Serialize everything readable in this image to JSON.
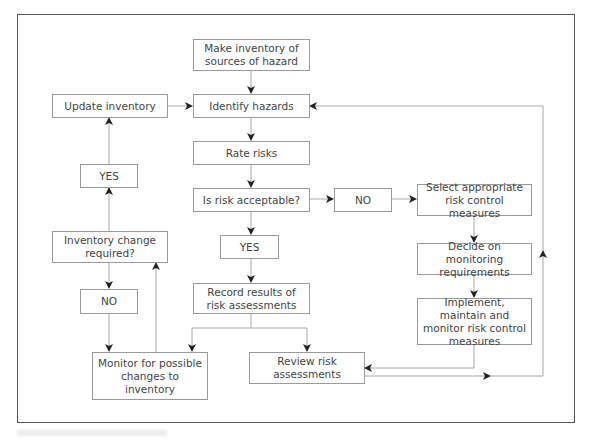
{
  "diagram": {
    "nodes": {
      "make_inventory": "Make inventory of sources of hazard",
      "update_inventory": "Update inventory",
      "identify_hazards": "Identify hazards",
      "rate_risks": "Rate risks",
      "yes_left": "YES",
      "is_risk_acceptable": "Is risk acceptable?",
      "no_middle": "NO",
      "select_measures": "Select appropriate risk control measures",
      "inventory_change": "Inventory change required?",
      "yes_center": "YES",
      "decide_monitoring": "Decide on monitoring requirements",
      "no_left": "NO",
      "record_results": "Record results of risk assessments",
      "implement": "Implement, maintain and monitor risk control measures",
      "monitor_changes": "Monitor for possible changes to inventory",
      "review": "Review risk assessments"
    },
    "edges": [
      [
        "make_inventory",
        "identify_hazards"
      ],
      [
        "update_inventory",
        "identify_hazards"
      ],
      [
        "identify_hazards",
        "rate_risks"
      ],
      [
        "rate_risks",
        "is_risk_acceptable"
      ],
      [
        "is_risk_acceptable",
        "no_middle"
      ],
      [
        "no_middle",
        "select_measures"
      ],
      [
        "is_risk_acceptable",
        "yes_center"
      ],
      [
        "yes_center",
        "record_results"
      ],
      [
        "select_measures",
        "decide_monitoring"
      ],
      [
        "decide_monitoring",
        "implement"
      ],
      [
        "implement",
        "review"
      ],
      [
        "record_results",
        "monitor_changes"
      ],
      [
        "record_results",
        "review"
      ],
      [
        "review",
        "identify_hazards"
      ],
      [
        "monitor_changes",
        "inventory_change"
      ],
      [
        "inventory_change",
        "yes_left"
      ],
      [
        "yes_left",
        "update_inventory"
      ],
      [
        "inventory_change",
        "no_left"
      ],
      [
        "no_left",
        "monitor_changes"
      ]
    ],
    "colors": {
      "box_border": "#9a9a9a",
      "line": "#a8a8a8",
      "arrow": "#222222",
      "text": "#444444",
      "frame": "#555555"
    }
  }
}
